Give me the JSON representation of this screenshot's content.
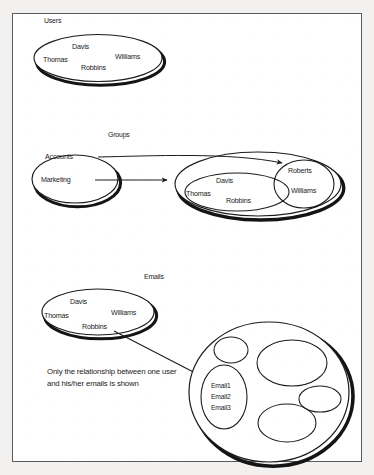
{
  "document": {
    "background_color": "#f2f1ef",
    "page_color": "#ffffff",
    "ink_color": "#1b1b1b",
    "border_color": "#5a5a5a"
  },
  "sections": {
    "users": {
      "title": "Users",
      "members": [
        "Davis",
        "Williams",
        "Thomas",
        "Robbins"
      ]
    },
    "groups": {
      "title": "Groups",
      "group_names": [
        "Accounts",
        "Marketing"
      ],
      "members_inner": [
        "Davis",
        "Williams",
        "Thomas",
        "Robbins"
      ],
      "members_outer": [
        "Roberts",
        "Williams"
      ]
    },
    "emails": {
      "title": "Emails",
      "members": [
        "Davis",
        "Williams",
        "Thomas",
        "Robbins"
      ],
      "email_items": [
        "Email1",
        "Email2",
        "Email3"
      ],
      "caption": "Only the relationship between one user and his/her emails is shown"
    }
  }
}
